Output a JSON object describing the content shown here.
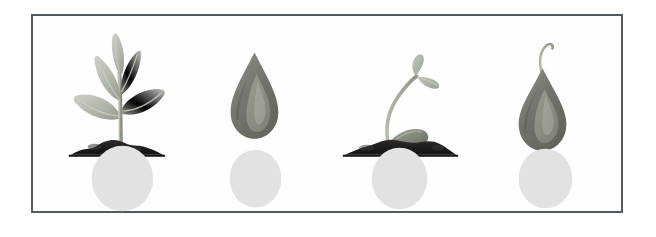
{
  "figure": {
    "kind": "illustration",
    "panel_count": 4,
    "background_color": "#ffffff",
    "frame": {
      "border_color": "#555a5e",
      "border_width_px": 2,
      "fill_color": "#fefefe",
      "x": 31,
      "y": 14,
      "width": 592,
      "height": 199
    },
    "palette": {
      "soil_dark": "#1d1b19",
      "soil_mid": "#2c2a27",
      "leaf_light": "#c2c5bd",
      "leaf_mid": "#aaaea4",
      "leaf_dark": "#8e948a",
      "stem": "#a3a89c",
      "seed_dark": "#6e726d",
      "seed_mid": "#7d8178",
      "seed_light": "#9aa093",
      "seed_highlight": "#b2b7a9",
      "ground_circle": "#e2e3e0",
      "sprout_pale": "#b7bcb0"
    }
  },
  "panels": [
    {
      "id": "panel-1",
      "name": "young-seedling-in-soil",
      "stage_index": 1,
      "elements": [
        "leaves",
        "stem",
        "soil-mound",
        "ground-circle"
      ],
      "leaf_count": 5,
      "ground_circle": {
        "cx": 90,
        "cy": 163,
        "rx": 31,
        "ry": 33
      }
    },
    {
      "id": "panel-2",
      "name": "dormant-seed",
      "stage_index": 2,
      "elements": [
        "seed",
        "ground-circle"
      ],
      "leaf_count": 0,
      "ground_circle": {
        "cx": 76,
        "cy": 163,
        "rx": 26,
        "ry": 29
      }
    },
    {
      "id": "panel-3",
      "name": "sprouting-seed-in-soil",
      "stage_index": 3,
      "elements": [
        "cotyledons",
        "curved-stem",
        "seed",
        "soil-mound",
        "ground-circle"
      ],
      "leaf_count": 2,
      "ground_circle": {
        "cx": 73,
        "cy": 163,
        "rx": 28,
        "ry": 31
      }
    },
    {
      "id": "panel-4",
      "name": "germinating-seed-with-shoot",
      "stage_index": 4,
      "elements": [
        "seed",
        "emerging-shoot",
        "ground-circle"
      ],
      "leaf_count": 0,
      "ground_circle": {
        "cx": 72,
        "cy": 163,
        "rx": 27,
        "ry": 30
      }
    }
  ]
}
